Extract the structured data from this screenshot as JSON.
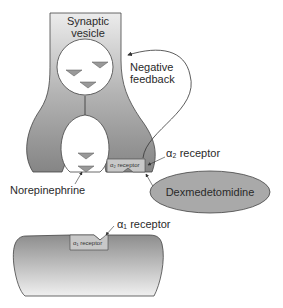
{
  "diagram": {
    "labels": {
      "synaptic_vesicle_line1": "Synaptic",
      "synaptic_vesicle_line2": "vesicle",
      "negative_feedback_line1": "Negative",
      "negative_feedback_line2": "feedback",
      "alpha2_receptor": "α₂ receptor",
      "alpha2_receptor_inner": "α₂ receptor",
      "norepinephrine": "Norepinephrine",
      "dexmedetomidine": "Dexmedetomidine",
      "alpha1_receptor": "α₁ receptor",
      "alpha1_receptor_inner": "α₁ receptor"
    },
    "colors": {
      "neuron_top": "#e8e8e8",
      "neuron_bottom": "#8a8a8a",
      "ellipse_fill": "#a9a9a9",
      "receptor_fill": "#c8c8c8",
      "triangle_fill": "#999999",
      "stroke": "#333333"
    }
  }
}
